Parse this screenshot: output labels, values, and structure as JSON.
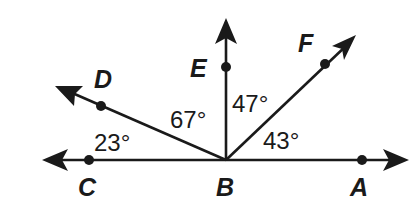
{
  "diagram": {
    "type": "angle-diagram",
    "vertex": "B",
    "points": [
      {
        "id": "A",
        "label": "A"
      },
      {
        "id": "B",
        "label": "B"
      },
      {
        "id": "C",
        "label": "C"
      },
      {
        "id": "D",
        "label": "D"
      },
      {
        "id": "E",
        "label": "E"
      },
      {
        "id": "F",
        "label": "F"
      }
    ],
    "rays": [
      "BA",
      "BC",
      "BD",
      "BE",
      "BF"
    ],
    "angles": [
      {
        "name": "CBD",
        "label": "23°",
        "value": 23
      },
      {
        "name": "DBE",
        "label": "67°",
        "value": 67
      },
      {
        "name": "EBF",
        "label": "47°",
        "value": 47
      },
      {
        "name": "FBA",
        "label": "43°",
        "value": 43
      }
    ]
  }
}
